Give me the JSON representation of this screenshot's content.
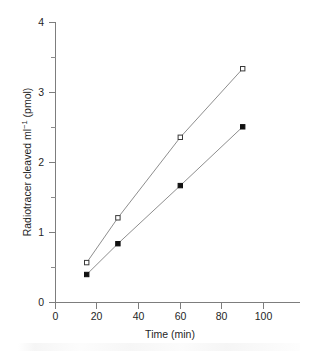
{
  "chart_data": {
    "type": "line",
    "title": "",
    "xlabel": "Time (min)",
    "ylabel": "Radiotracer cleaved ml⁻¹ (pmol)",
    "ylabel_parts": {
      "main": "Radiotracer cleaved ml",
      "superscript": "−1",
      "tail": " (pmol)"
    },
    "xlim": [
      0,
      115
    ],
    "ylim": [
      0,
      4
    ],
    "grid": false,
    "legend": "none",
    "x_ticks": [
      0,
      20,
      40,
      60,
      80,
      100
    ],
    "x_tick_labels": [
      "0",
      "20",
      "40",
      "60",
      "80",
      "100"
    ],
    "x_minor_ticks": [
      10,
      30,
      50,
      70,
      90,
      110
    ],
    "y_ticks": [
      0,
      1,
      2,
      3,
      4
    ],
    "y_tick_labels": [
      "0",
      "1",
      "2",
      "3",
      "4"
    ],
    "y_minor_ticks": [
      0.5,
      1.5,
      2.5,
      3.5
    ],
    "x": [
      15,
      30,
      60,
      90
    ],
    "series": [
      {
        "name": "open-square-series",
        "marker": "open-square",
        "color": "#333333",
        "values": [
          0.57,
          1.21,
          2.36,
          3.34
        ]
      },
      {
        "name": "filled-square-series",
        "marker": "filled-square",
        "color": "#111111",
        "values": [
          0.4,
          0.84,
          1.67,
          2.51
        ]
      }
    ]
  },
  "axis": {
    "x_title": "Time (min)",
    "y_title_main": "Radiotracer cleaved ml",
    "y_title_sup": "−1",
    "y_title_tail": " (pmol)",
    "x_labels": {
      "t0": "0",
      "t20": "20",
      "t40": "40",
      "t60": "60",
      "t80": "80",
      "t100": "100"
    },
    "y_labels": {
      "v0": "0",
      "v1": "1",
      "v2": "2",
      "v3": "3",
      "v4": "4"
    }
  }
}
